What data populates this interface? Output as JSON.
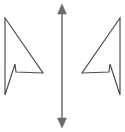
{
  "figure": {
    "background_color": "#ffffff",
    "width": 125,
    "height": 132
  },
  "style": {
    "cursor_stroke_color": "#4a4a4a",
    "cursor_stroke_width": 1.15,
    "axis_stroke_color": "#6b6b6b",
    "axis_stroke_width": 1.5
  },
  "shapes": {
    "left_cursor": {
      "label": "left-cursor-arrow",
      "orientation": "pointing-right-down",
      "points": "5,18 43,73 16,72 15,64 5,95"
    },
    "right_cursor": {
      "label": "right-cursor-arrow",
      "orientation": "pointing-left-down",
      "points": "120,18 82,73 109,72 110,64 120,95"
    },
    "vertical_arrow": {
      "label": "vertical-double-headed-arrow",
      "shaft_x": 62,
      "shaft_top_y": 8,
      "shaft_bottom_y": 124,
      "top_head": "62,4 57.5,14 66.5,14",
      "bottom_head": "62,128 57.5,118 66.5,118"
    }
  }
}
